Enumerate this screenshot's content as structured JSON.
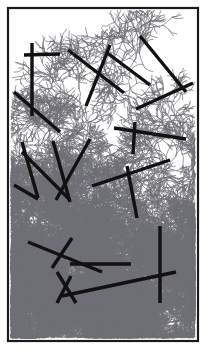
{
  "figure": {
    "title": "",
    "caption": "",
    "kind": "fractal-aggregate-with-fibers",
    "width": 206,
    "height": 349
  },
  "colors": {
    "background": "#ffffff",
    "frame": "#1a1a1a",
    "fiber": "#111111",
    "aggregate": "#6e6e76",
    "aggregate_dense": "#4a4a52"
  },
  "frame": {
    "x": 8,
    "y": 8,
    "width": 190,
    "height": 333,
    "stroke_width": 2.2
  },
  "aggregate": {
    "seed_x": 100,
    "seed_y": 10,
    "growth_direction": "downward",
    "density_gradient": "sparse-top to dense-bottom",
    "stroke_width": 0.7,
    "branch_count": 9,
    "note": "Dendritic branching cluster nucleated at the top edge and grown toward the bottom, filling the lower half densely"
  },
  "fibers": {
    "stroke_width": 3.4,
    "count": 22,
    "segments": [
      {
        "id": "f01",
        "x1": 24,
        "y1": 55,
        "x2": 60,
        "y2": 54
      },
      {
        "id": "f02",
        "x1": 32,
        "y1": 43,
        "x2": 32,
        "y2": 116
      },
      {
        "id": "f03",
        "x1": 14,
        "y1": 92,
        "x2": 60,
        "y2": 132
      },
      {
        "id": "f04",
        "x1": 68,
        "y1": 50,
        "x2": 124,
        "y2": 93
      },
      {
        "id": "f05",
        "x1": 110,
        "y1": 45,
        "x2": 86,
        "y2": 106
      },
      {
        "id": "f06",
        "x1": 106,
        "y1": 52,
        "x2": 150,
        "y2": 85
      },
      {
        "id": "f07",
        "x1": 140,
        "y1": 36,
        "x2": 186,
        "y2": 92
      },
      {
        "id": "f08",
        "x1": 136,
        "y1": 109,
        "x2": 193,
        "y2": 83
      },
      {
        "id": "f09",
        "x1": 114,
        "y1": 128,
        "x2": 186,
        "y2": 139
      },
      {
        "id": "f10",
        "x1": 135,
        "y1": 122,
        "x2": 133,
        "y2": 154
      },
      {
        "id": "f11",
        "x1": 22,
        "y1": 142,
        "x2": 38,
        "y2": 198
      },
      {
        "id": "f12",
        "x1": 22,
        "y1": 152,
        "x2": 70,
        "y2": 200
      },
      {
        "id": "f13",
        "x1": 53,
        "y1": 141,
        "x2": 70,
        "y2": 202
      },
      {
        "id": "f14",
        "x1": 14,
        "y1": 185,
        "x2": 38,
        "y2": 199
      },
      {
        "id": "f15",
        "x1": 90,
        "y1": 139,
        "x2": 56,
        "y2": 200
      },
      {
        "id": "f16",
        "x1": 92,
        "y1": 186,
        "x2": 170,
        "y2": 160
      },
      {
        "id": "f17",
        "x1": 127,
        "y1": 166,
        "x2": 137,
        "y2": 218
      },
      {
        "id": "f18",
        "x1": 28,
        "y1": 242,
        "x2": 102,
        "y2": 272
      },
      {
        "id": "f19",
        "x1": 72,
        "y1": 238,
        "x2": 52,
        "y2": 268
      },
      {
        "id": "f20",
        "x1": 70,
        "y1": 264,
        "x2": 131,
        "y2": 264
      },
      {
        "id": "f21",
        "x1": 57,
        "y1": 303,
        "x2": 71,
        "y2": 276
      },
      {
        "id": "f22",
        "x1": 57,
        "y1": 272,
        "x2": 76,
        "y2": 303
      },
      {
        "id": "f23",
        "x1": 62,
        "y1": 296,
        "x2": 176,
        "y2": 272
      },
      {
        "id": "f24",
        "x1": 160,
        "y1": 226,
        "x2": 160,
        "y2": 303
      }
    ]
  }
}
